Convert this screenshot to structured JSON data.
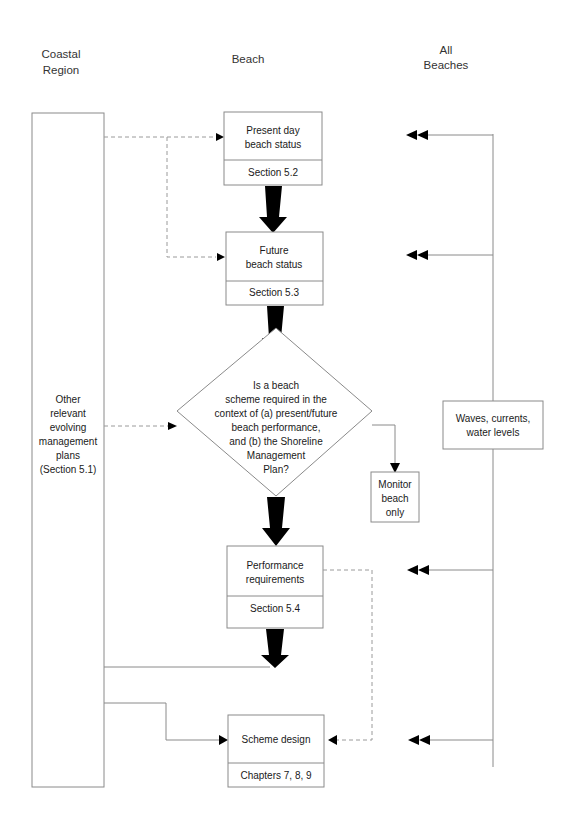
{
  "headers": {
    "coastal_region": [
      "Coastal",
      "Region"
    ],
    "beach": "Beach",
    "all_beaches": [
      "All",
      "Beaches"
    ]
  },
  "coastal_box": {
    "lines": [
      "Other",
      "relevant",
      "evolving",
      "management",
      "plans",
      "(Section 5.1)"
    ]
  },
  "present_day": {
    "lines": [
      "Present day",
      "beach status"
    ],
    "ref": "Section 5.2"
  },
  "future": {
    "lines": [
      "Future",
      "beach status"
    ],
    "ref": "Section 5.3"
  },
  "decision": {
    "lines": [
      "Is a beach",
      "scheme required in the",
      "context of (a) present/future",
      "beach performance,",
      "and (b) the Shoreline",
      "Management",
      "Plan?"
    ]
  },
  "monitor": {
    "lines": [
      "Monitor",
      "beach",
      "only"
    ]
  },
  "performance": {
    "lines": [
      "Performance",
      "requirements"
    ],
    "ref": "Section 5.4"
  },
  "scheme_design": {
    "lines": [
      "Scheme design"
    ],
    "ref": "Chapters 7, 8, 9"
  },
  "waves": {
    "lines": [
      "Waves, currents,",
      "water levels"
    ]
  }
}
